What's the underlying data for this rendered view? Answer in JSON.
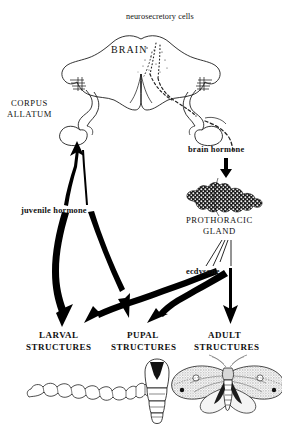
{
  "diagram": {
    "background_color": "#ffffff",
    "ink_color": "#000000"
  },
  "labels": {
    "neurosecretory_cells": "neurosecretory cells",
    "brain": "BRAIN",
    "corpus_allatum_line1": "CORPUS",
    "corpus_allatum_line2": "ALLATUM",
    "brain_hormone": "brain hormone",
    "juvenile_hormone": "juvenile  hormone",
    "prothoracic_gland_line1": "PROTHORACIC",
    "prothoracic_gland_line2": "GLAND",
    "ecdysone": "ecdysone",
    "larval_line1": "LARVAL",
    "larval_line2": "STRUCTURES",
    "pupal_line1": "PUPAL",
    "pupal_line2": "STRUCTURES",
    "adult_line1": "ADULT",
    "adult_line2": "STRUCTURES"
  },
  "figures": {
    "brain_organ": "brain-organ-drawing",
    "corpus_allatum_organ": "corpus-allatum-drawing",
    "prothoracic_gland_organ": "prothoracic-gland-drawing",
    "larva": "caterpillar-drawing",
    "pupa": "pupa-drawing",
    "adult": "moth-drawing"
  },
  "arrows": {
    "brain_hormone_arrow": "brain-hormone-to-gland-arrow",
    "jh_to_larval": "juvenile-hormone-to-larval-arrow",
    "jh_to_pupal": "juvenile-hormone-to-pupal-arrow",
    "ecdysone_to_larval": "ecdysone-to-larval-arrow",
    "ecdysone_to_pupal": "ecdysone-to-pupal-arrow",
    "ecdysone_to_adult": "ecdysone-to-adult-arrow"
  }
}
